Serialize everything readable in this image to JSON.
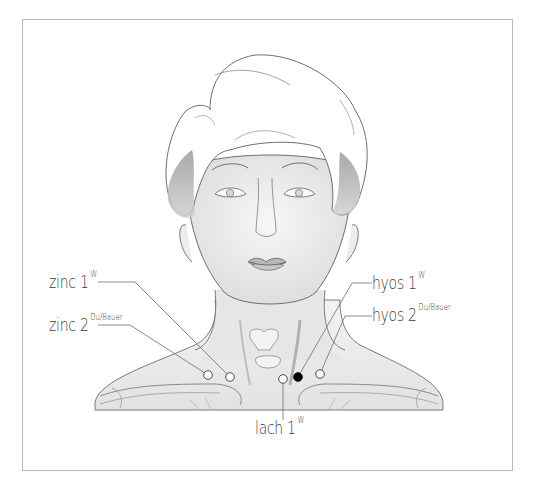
{
  "figure": {
    "type": "acupuncture-point diagram",
    "points": [
      {
        "id": "zinc1",
        "name": "zinc 1",
        "superscript": "W",
        "side": "left",
        "marker": "open",
        "x": 230,
        "y": 377
      },
      {
        "id": "zinc2",
        "name": "zinc 2",
        "superscript": "Du/Bauer",
        "side": "left",
        "marker": "open",
        "x": 208,
        "y": 375
      },
      {
        "id": "hyos1",
        "name": "hyos 1",
        "superscript": "W",
        "side": "right",
        "marker": "filled",
        "x": 298,
        "y": 377
      },
      {
        "id": "hyos2",
        "name": "hyos 2",
        "superscript": "Du/Bauer",
        "side": "right",
        "marker": "open",
        "x": 320,
        "y": 374
      },
      {
        "id": "lach1",
        "name": "lach 1",
        "superscript": "W",
        "side": "bottom",
        "marker": "open",
        "x": 283,
        "y": 379
      }
    ],
    "colors": {
      "line": "#6e6e6e",
      "label_text": "#3c3c3c",
      "frame": "#b9b9b9",
      "filled_marker": "#000000",
      "open_marker_fill": "#ffffff"
    }
  }
}
